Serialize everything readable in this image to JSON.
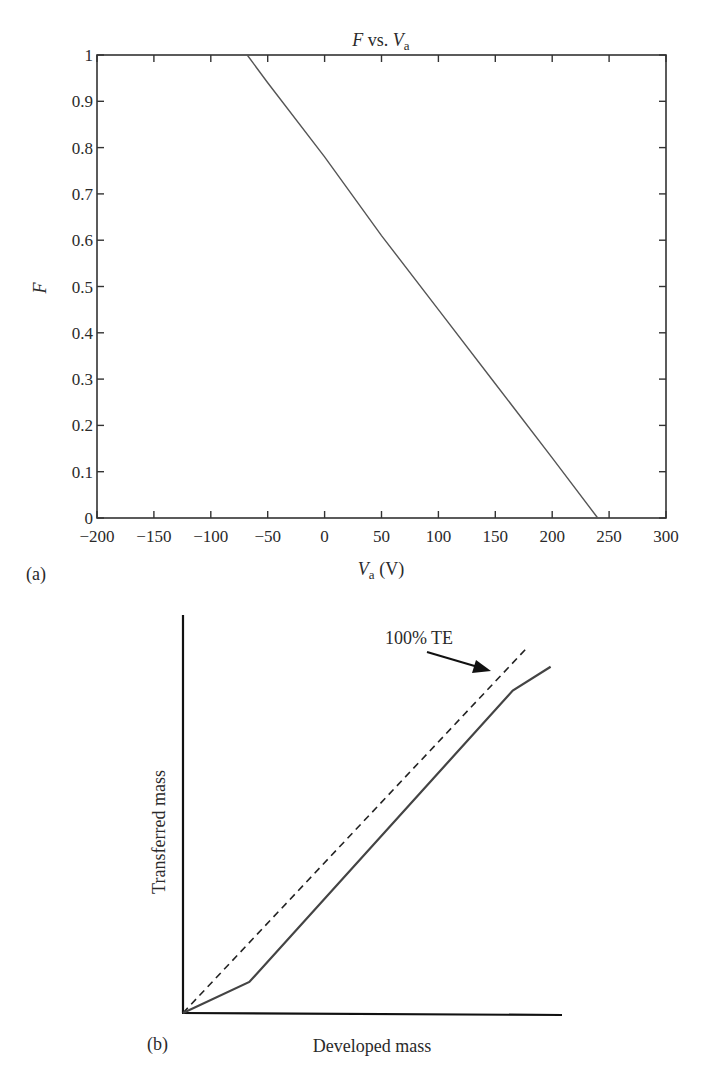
{
  "chart_data": [
    {
      "panel": "(a)",
      "type": "line",
      "title": "F vs. Va",
      "title_parts": {
        "main": "F",
        "mid": " vs. ",
        "var": "V",
        "sub": "a"
      },
      "xlabel": "Va (V)",
      "xlabel_parts": {
        "var": "V",
        "sub": "a",
        "unit": " (V)"
      },
      "ylabel": "F",
      "xlim": [
        -200,
        300
      ],
      "ylim": [
        0,
        1
      ],
      "xticks": [
        -200,
        -150,
        -100,
        -50,
        0,
        50,
        100,
        150,
        200,
        250,
        300
      ],
      "xtick_labels": [
        "−200",
        "−150",
        "−100",
        "−50",
        "0",
        "50",
        "100",
        "150",
        "200",
        "250",
        "300"
      ],
      "yticks": [
        0,
        0.1,
        0.2,
        0.3,
        0.4,
        0.5,
        0.6,
        0.7,
        0.8,
        0.9,
        1
      ],
      "ytick_labels": [
        "0",
        "0.1",
        "0.2",
        "0.3",
        "0.4",
        "0.5",
        "0.6",
        "0.7",
        "0.8",
        "0.9",
        "1"
      ],
      "grid": false,
      "series": [
        {
          "name": "F",
          "x": [
            -68,
            -50,
            0,
            50,
            100,
            150,
            200,
            240
          ],
          "y": [
            1.0,
            0.94,
            0.78,
            0.61,
            0.45,
            0.29,
            0.13,
            0.0
          ]
        }
      ],
      "line_color": "#555555"
    },
    {
      "panel": "(b)",
      "type": "line",
      "title": "",
      "xlabel": "Developed mass",
      "ylabel": "Transferred mass",
      "grid": false,
      "axes_ticks": false,
      "annotation": {
        "text": "100% TE",
        "arrow_to": "dashed line"
      },
      "series": [
        {
          "name": "100% TE",
          "style": "dashed",
          "x": [
            0,
            0.91
          ],
          "y": [
            0,
            0.92
          ]
        },
        {
          "name": "Transferred mass",
          "style": "solid",
          "x": [
            0,
            0.175,
            0.87,
            0.97
          ],
          "y": [
            0,
            0.078,
            0.81,
            0.87
          ]
        }
      ]
    }
  ]
}
